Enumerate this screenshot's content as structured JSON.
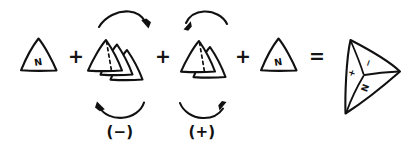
{
  "figure": {
    "background_color": "#ffffff",
    "ink_color": "#111111",
    "width": 412,
    "height": 149
  },
  "equation": {
    "operators": [
      {
        "symbol": "+",
        "name": "plus-operator-1"
      },
      {
        "symbol": "+",
        "name": "plus-operator-2"
      },
      {
        "symbol": "+",
        "name": "plus-operator-3"
      },
      {
        "symbol": "=",
        "name": "equals-operator"
      }
    ]
  },
  "terms": [
    {
      "id": "term-single-triangle-left",
      "kind": "single-triangle",
      "label": "N",
      "triangle_count": 1,
      "has_hidden_edge": false,
      "rotation_annotation": null
    },
    {
      "id": "term-triangle-stack-negative",
      "kind": "triangle-stack",
      "label": "",
      "triangle_count": 3,
      "has_hidden_edge": true,
      "rotation_annotation": {
        "sign_label": "(−)",
        "top_arrow_direction": "clockwise",
        "bottom_arrow_direction": "counterclockwise"
      }
    },
    {
      "id": "term-triangle-stack-positive",
      "kind": "triangle-stack",
      "label": "",
      "triangle_count": 2,
      "has_hidden_edge": true,
      "rotation_annotation": {
        "sign_label": "(+)",
        "top_arrow_direction": "counterclockwise",
        "bottom_arrow_direction": "clockwise"
      }
    },
    {
      "id": "term-single-triangle-right",
      "kind": "single-triangle",
      "label": "N",
      "triangle_count": 1,
      "has_hidden_edge": false,
      "rotation_annotation": null
    }
  ],
  "result": {
    "id": "result-tetrahedron",
    "kind": "tetrahedron",
    "face_labels": [
      {
        "name": "face-label-plus",
        "text": "+"
      },
      {
        "name": "face-label-minus",
        "text": "−"
      },
      {
        "name": "face-label-n",
        "text": "N"
      }
    ]
  }
}
